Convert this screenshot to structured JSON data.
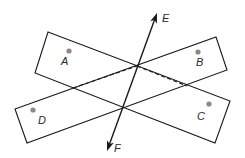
{
  "diagram": {
    "colors": {
      "stroke": "#1a1a1a",
      "point": "#8a8a8a",
      "label": "#2a2a2a",
      "background": "#ffffff"
    },
    "planes": [
      {
        "name": "plane-AC",
        "corners": [
          [
            48,
            32
          ],
          [
            230,
            101
          ],
          [
            215,
            143
          ],
          [
            35,
            73
          ]
        ]
      },
      {
        "name": "plane-DB",
        "corners": [
          [
            15,
            109
          ],
          [
            216,
            37
          ],
          [
            227,
            70
          ],
          [
            27,
            143
          ]
        ]
      }
    ],
    "hidden_edges": [
      {
        "from": [
          73,
          88
        ],
        "to": [
          137,
          66
        ]
      },
      {
        "from": [
          137,
          66
        ],
        "to": [
          187,
          86
        ]
      }
    ],
    "line": {
      "name": "EF",
      "from": [
        107,
        151
      ],
      "to": [
        157,
        13
      ]
    },
    "points": [
      {
        "id": "A",
        "label": "A",
        "dot": [
          69,
          51
        ],
        "label_pos": [
          61,
          65
        ]
      },
      {
        "id": "B",
        "label": "B",
        "dot": [
          198,
          52
        ],
        "label_pos": [
          196,
          66
        ]
      },
      {
        "id": "C",
        "label": "C",
        "dot": [
          209,
          104
        ],
        "label_pos": [
          197,
          120
        ]
      },
      {
        "id": "D",
        "label": "D",
        "dot": [
          33,
          110
        ],
        "label_pos": [
          38,
          124
        ]
      }
    ],
    "line_labels": [
      {
        "id": "E",
        "label": "E",
        "pos": [
          162,
          22
        ]
      },
      {
        "id": "F",
        "label": "F",
        "pos": [
          114,
          152
        ]
      }
    ]
  }
}
